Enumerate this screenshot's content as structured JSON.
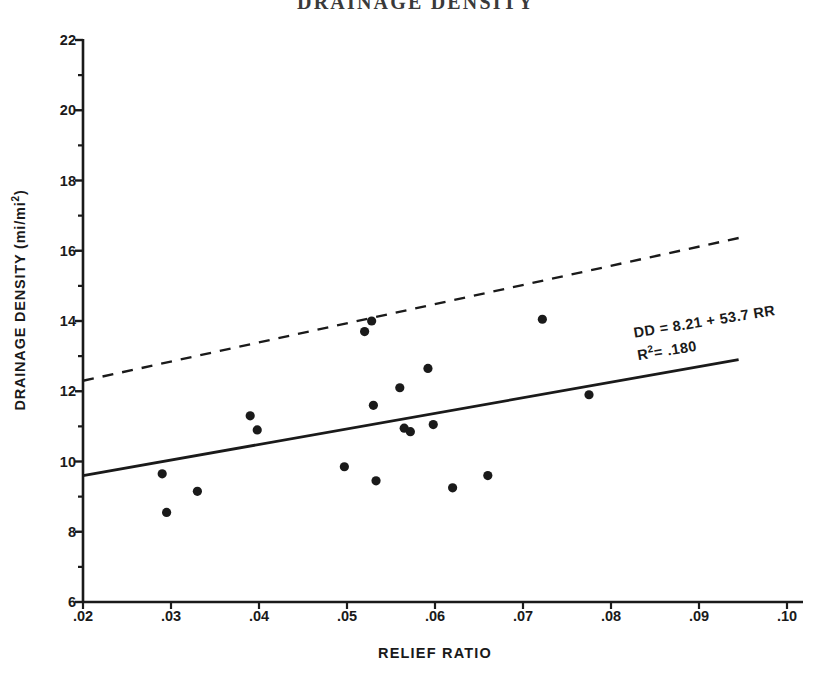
{
  "chart_data": {
    "type": "scatter",
    "title": "DRAINAGE DENSITY",
    "xlabel": "RELIEF RATIO",
    "ylabel": "DRAINAGE DENSITY (mi/mi",
    "ylabel_sup": "2",
    "ylabel_suffix": ")",
    "xlim": [
      0.02,
      0.1
    ],
    "ylim": [
      6,
      22
    ],
    "xticks": [
      0.02,
      0.03,
      0.04,
      0.05,
      0.06,
      0.07,
      0.08,
      0.09,
      0.1
    ],
    "xtick_labels": [
      ".02",
      ".03",
      ".04",
      ".05",
      ".06",
      ".07",
      ".08",
      ".09",
      ".10"
    ],
    "yticks": [
      6,
      8,
      10,
      12,
      14,
      16,
      18,
      20,
      22
    ],
    "ytick_labels": [
      "6",
      "8",
      "10",
      "12",
      "14",
      "16",
      "18",
      "20",
      "22"
    ],
    "yticks_minor": [
      7,
      9,
      11,
      13,
      15,
      17,
      19,
      21
    ],
    "grid": false,
    "legend": "none",
    "points": [
      {
        "x": 0.029,
        "y": 9.65
      },
      {
        "x": 0.0295,
        "y": 8.55
      },
      {
        "x": 0.033,
        "y": 9.15
      },
      {
        "x": 0.039,
        "y": 11.3
      },
      {
        "x": 0.0398,
        "y": 10.9
      },
      {
        "x": 0.0497,
        "y": 9.85
      },
      {
        "x": 0.052,
        "y": 13.7
      },
      {
        "x": 0.0528,
        "y": 14.0
      },
      {
        "x": 0.053,
        "y": 11.6
      },
      {
        "x": 0.0533,
        "y": 9.45
      },
      {
        "x": 0.056,
        "y": 12.1
      },
      {
        "x": 0.0565,
        "y": 10.95
      },
      {
        "x": 0.0572,
        "y": 10.85
      },
      {
        "x": 0.0592,
        "y": 12.65
      },
      {
        "x": 0.0598,
        "y": 11.05
      },
      {
        "x": 0.062,
        "y": 9.25
      },
      {
        "x": 0.066,
        "y": 9.6
      },
      {
        "x": 0.0722,
        "y": 14.05
      },
      {
        "x": 0.0775,
        "y": 11.9
      }
    ],
    "regression_line": {
      "style": "solid",
      "equation": "DD = 8.21 + 53.7 RR",
      "r_squared_label": "R",
      "r_squared_sup": "2",
      "r_squared_value": "= .180",
      "intercept": 8.21,
      "slope": 53.7,
      "x_start": 0.02,
      "x_end": 0.0945,
      "y_start": 9.6,
      "y_end": 12.9
    },
    "upper_line": {
      "style": "dashed",
      "x_start": 0.02,
      "x_end": 0.0952,
      "y_start": 12.3,
      "y_end": 16.4
    }
  }
}
